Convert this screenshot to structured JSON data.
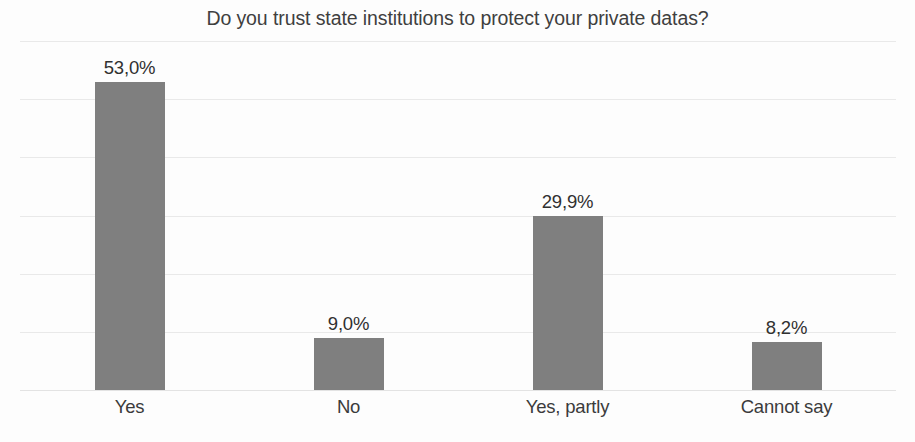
{
  "chart_data": {
    "type": "bar",
    "title": "Do you trust state institutions to protect your private datas?",
    "xlabel": "",
    "ylabel": "",
    "categories": [
      "Yes",
      "No",
      "Yes, partly",
      "Cannot say"
    ],
    "values": [
      53.0,
      9.0,
      29.9,
      8.2
    ],
    "value_labels": [
      "53,0%",
      "9,0%",
      "29,9%",
      "8,2%"
    ],
    "ylim": [
      0,
      60
    ],
    "y_tick_labels_visible": false,
    "gridlines": [
      60,
      50,
      40,
      30,
      20,
      10,
      0
    ],
    "grid": true,
    "legend": false,
    "legend_position": "none",
    "series": [
      {
        "name": "Share of respondents",
        "values": [
          53.0,
          9.0,
          29.9,
          8.2
        ]
      }
    ],
    "colors": {
      "bar": "#7f7f7f",
      "gridline": "#e9e9e9",
      "baseline": "#e3e3e3",
      "title_text": "#3f3f3f",
      "label_text": "#3b3b3b",
      "value_text": "#303030",
      "background": "#fdfdfd"
    }
  }
}
